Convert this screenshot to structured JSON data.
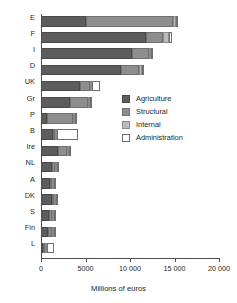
{
  "chart_data": {
    "type": "bar",
    "orientation": "horizontal",
    "stacked": true,
    "title": "",
    "xlabel": "Millions of euros",
    "ylabel": "",
    "xlim": [
      0,
      20000
    ],
    "xticks": [
      0,
      5000,
      10000,
      15000,
      20000
    ],
    "xticklabels": [
      "0",
      "5000",
      "10 000",
      "15 000",
      "20 000"
    ],
    "grid": false,
    "legend_position": "center-right",
    "categories": [
      "E",
      "F",
      "I",
      "D",
      "UK",
      "Gr",
      "P",
      "B",
      "Ire",
      "NL",
      "A",
      "DK",
      "S",
      "Fin",
      "L"
    ],
    "series": [
      {
        "name": "Agriculture",
        "color": "#5c5c5c",
        "values": [
          5000,
          11800,
          10200,
          9000,
          4400,
          3300,
          700,
          1300,
          1900,
          1250,
          1000,
          1250,
          900,
          800,
          30
        ]
      },
      {
        "name": "Structural",
        "color": "#8e8e8e",
        "values": [
          9800,
          1900,
          1900,
          2000,
          1100,
          2000,
          2900,
          300,
          1000,
          350,
          200,
          250,
          350,
          400,
          40
        ]
      },
      {
        "name": "Internal",
        "color": "#bcbcbc",
        "values": [
          400,
          700,
          250,
          300,
          150,
          250,
          200,
          150,
          120,
          120,
          120,
          120,
          120,
          120,
          50
        ]
      },
      {
        "name": "Administration",
        "color": "#ffffff",
        "values": [
          150,
          300,
          120,
          120,
          950,
          120,
          120,
          2300,
          120,
          120,
          120,
          120,
          120,
          120,
          800
        ]
      }
    ],
    "totals": [
      15350,
      14700,
      12470,
      11420,
      6600,
      5670,
      3920,
      4050,
      3140,
      1840,
      1440,
      1740,
      1490,
      1440,
      920
    ]
  },
  "legend": {
    "items": [
      {
        "label": "Agriculture"
      },
      {
        "label": "Structural"
      },
      {
        "label": "Internal"
      },
      {
        "label": "Administration"
      }
    ]
  }
}
